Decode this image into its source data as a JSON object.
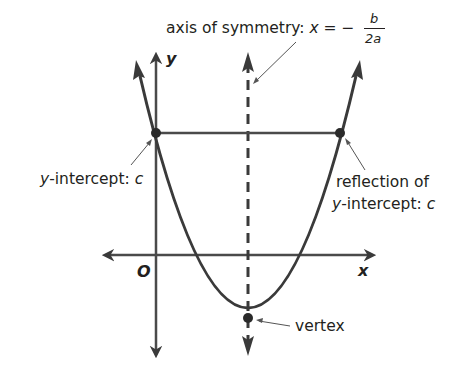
{
  "diagram": {
    "type": "parabola-key-features",
    "labels": {
      "axis_of_symmetry_prefix": "axis of symmetry: ",
      "axis_of_symmetry_var": "x",
      "axis_of_symmetry_eq": " = −",
      "fraction_numerator": "b",
      "fraction_denominator": "2a",
      "y_intercept_var": "y",
      "y_intercept_text": "-intercept: ",
      "y_intercept_const": "c",
      "reflection_line1": "reflection of",
      "reflection_var": "y",
      "reflection_text": "-intercept: ",
      "reflection_const": "c",
      "vertex": "vertex",
      "x_axis": "x",
      "y_axis": "y",
      "origin": "O"
    },
    "colors": {
      "stroke": "#3a3a3a",
      "text": "#231f20",
      "background": "#ffffff"
    }
  }
}
